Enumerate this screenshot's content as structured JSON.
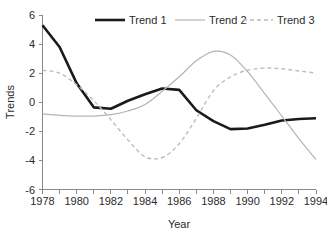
{
  "chart_data": {
    "type": "line",
    "title": "",
    "xlabel": "Year",
    "ylabel": "Trends",
    "xlim": [
      1978,
      1994
    ],
    "ylim": [
      -6,
      6
    ],
    "xticks": [
      1978,
      1980,
      1982,
      1984,
      1986,
      1988,
      1990,
      1992,
      1994
    ],
    "xtick_labels": [
      "1978",
      "1980",
      "1982",
      "1984",
      "1986",
      "1988",
      "1990",
      "1992",
      "1994"
    ],
    "yticks": [
      6,
      4,
      2,
      0,
      -2,
      -4,
      -6
    ],
    "ytick_labels": [
      "6",
      "4",
      "2",
      "0",
      "-2",
      "-4",
      "-6"
    ],
    "grid": false,
    "legend_position": "top",
    "x": [
      1978,
      1979,
      1980,
      1981,
      1982,
      1983,
      1984,
      1985,
      1986,
      1987,
      1988,
      1989,
      1990,
      1991,
      1992,
      1993,
      1994
    ],
    "series": [
      {
        "name": "Trend 1",
        "color": "#1a1a1a",
        "style": "solid",
        "width": 2.6,
        "values": [
          5.3,
          3.8,
          1.3,
          -0.35,
          -0.45,
          0.1,
          0.55,
          0.95,
          0.85,
          -0.55,
          -1.3,
          -1.85,
          -1.8,
          -1.55,
          -1.25,
          -1.15,
          -1.1
        ]
      },
      {
        "name": "Trend 2",
        "color": "#b4b4b4",
        "style": "solid",
        "width": 1.2,
        "values": [
          -0.8,
          -0.9,
          -0.95,
          -0.95,
          -0.85,
          -0.6,
          -0.15,
          0.75,
          1.75,
          2.85,
          3.5,
          3.25,
          2.1,
          0.6,
          -0.95,
          -2.5,
          -3.95
        ]
      },
      {
        "name": "Trend 3",
        "color": "#bdbdbd",
        "style": "dashed",
        "width": 1.4,
        "values": [
          2.2,
          2.0,
          1.2,
          0.1,
          -1.2,
          -2.6,
          -3.75,
          -3.8,
          -2.85,
          -1.1,
          0.8,
          1.75,
          2.2,
          2.35,
          2.3,
          2.15,
          2.0
        ]
      }
    ]
  },
  "legend": {
    "items": [
      {
        "label": "Trend 1"
      },
      {
        "label": "Trend 2"
      },
      {
        "label": "Trend 3"
      }
    ]
  }
}
